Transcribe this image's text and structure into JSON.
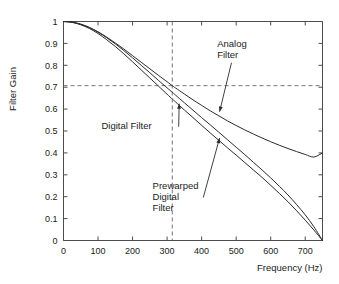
{
  "chart_data": {
    "type": "line",
    "title": "",
    "xlabel": "Frequency (Hz)",
    "ylabel": "Filter Gain",
    "xlim": [
      0,
      750
    ],
    "ylim": [
      0,
      1
    ],
    "grid": false,
    "legend_position": "inline-annotations",
    "xticks": [
      0,
      100,
      200,
      300,
      400,
      500,
      600,
      700
    ],
    "xtick_labels": [
      "0",
      "100",
      "200",
      "300",
      "400",
      "500",
      "600",
      "700"
    ],
    "yticks": [
      0,
      0.1,
      0.2,
      0.3,
      0.4,
      0.5,
      0.6,
      0.7,
      0.8,
      0.9,
      1
    ],
    "ytick_labels": [
      "0",
      "0.1",
      "0.2",
      "0.3",
      "0.4",
      "0.5",
      "0.6",
      "0.7",
      "0.8",
      "0.9",
      "1"
    ],
    "reference_lines": [
      {
        "orientation": "horizontal",
        "value": 0.707,
        "style": "dashed"
      },
      {
        "orientation": "vertical",
        "value": 315,
        "style": "dashed"
      }
    ],
    "series": [
      {
        "name": "Analog Filter",
        "x": [
          0,
          25,
          50,
          75,
          100,
          125,
          150,
          175,
          200,
          225,
          250,
          275,
          300,
          315,
          325,
          350,
          375,
          400,
          425,
          450,
          475,
          500,
          525,
          550,
          575,
          600,
          625,
          650,
          675,
          700,
          725,
          750
        ],
        "y": [
          1.0,
          0.997,
          0.988,
          0.973,
          0.953,
          0.929,
          0.902,
          0.874,
          0.844,
          0.814,
          0.784,
          0.754,
          0.725,
          0.707,
          0.696,
          0.669,
          0.642,
          0.617,
          0.592,
          0.569,
          0.546,
          0.525,
          0.505,
          0.486,
          0.468,
          0.451,
          0.435,
          0.42,
          0.406,
          0.393,
          0.381,
          0.4
        ]
      },
      {
        "name": "Digital Filter",
        "x": [
          0,
          25,
          50,
          75,
          100,
          125,
          150,
          175,
          200,
          225,
          250,
          275,
          300,
          315,
          325,
          350,
          375,
          400,
          425,
          450,
          475,
          500,
          525,
          550,
          575,
          600,
          625,
          650,
          675,
          700,
          725,
          750
        ],
        "y": [
          1.0,
          0.996,
          0.985,
          0.968,
          0.945,
          0.917,
          0.886,
          0.852,
          0.816,
          0.779,
          0.742,
          0.705,
          0.668,
          0.646,
          0.632,
          0.596,
          0.561,
          0.526,
          0.491,
          0.457,
          0.423,
          0.39,
          0.356,
          0.322,
          0.288,
          0.252,
          0.215,
          0.177,
          0.136,
          0.093,
          0.048,
          0.0
        ]
      },
      {
        "name": "Prewarped Digital Filter",
        "x": [
          0,
          25,
          50,
          75,
          100,
          125,
          150,
          175,
          200,
          225,
          250,
          275,
          300,
          315,
          325,
          350,
          375,
          400,
          425,
          450,
          475,
          500,
          525,
          550,
          575,
          600,
          625,
          650,
          675,
          700,
          725,
          750
        ],
        "y": [
          1.0,
          0.997,
          0.987,
          0.972,
          0.951,
          0.926,
          0.898,
          0.867,
          0.834,
          0.8,
          0.766,
          0.731,
          0.697,
          0.677,
          0.663,
          0.629,
          0.595,
          0.561,
          0.528,
          0.494,
          0.46,
          0.426,
          0.392,
          0.357,
          0.322,
          0.286,
          0.248,
          0.208,
          0.164,
          0.117,
          0.063,
          0.0
        ]
      }
    ],
    "annotations": [
      {
        "id": "analog",
        "lines": [
          "Analog",
          "Filter"
        ],
        "text_x": 445,
        "text_y": 0.885,
        "target_x": 452,
        "target_y": 0.588
      },
      {
        "id": "digital",
        "lines": [
          "Digital Filter"
        ],
        "text_x": 110,
        "text_y": 0.508,
        "target_x": 335,
        "target_y": 0.625
      },
      {
        "id": "prewarped",
        "lines": [
          "Prewarped",
          "Digital",
          "Filter"
        ],
        "text_x": 258,
        "text_y": 0.235,
        "target_x": 452,
        "target_y": 0.468
      }
    ]
  }
}
